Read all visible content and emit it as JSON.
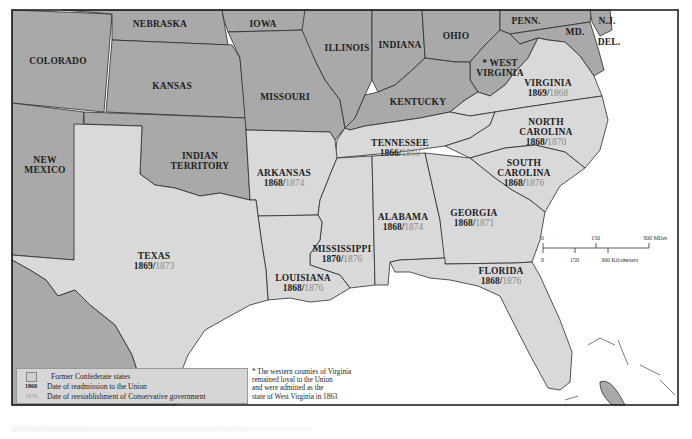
{
  "map": {
    "title": "Reconstruction: Readmission of Former Confederate States",
    "colors": {
      "union_states": "#a9a9a9",
      "confederate_states": "#d9d9d9",
      "water": "#ffffff",
      "readmission_year": "#1e1e1e",
      "conservative_year": "#8a8a8a"
    },
    "union_states": {
      "colorado": "COLORADO",
      "nebraska": "NEBRASKA",
      "iowa": "IOWA",
      "illinois": "ILLINOIS",
      "indiana": "INDIANA",
      "ohio": "OHIO",
      "penn": "PENN.",
      "nj": "N.J.",
      "md": "MD.",
      "del": "DEL.",
      "west_virginia_1": "* WEST",
      "west_virginia_2": "VIRGINIA",
      "kansas": "KANSAS",
      "missouri": "MISSOURI",
      "kentucky": "KENTUCKY",
      "new_mexico_1": "NEW",
      "new_mexico_2": "MEXICO",
      "indian_territory_1": "INDIAN",
      "indian_territory_2": "TERRITORY"
    },
    "confederate_states": {
      "virginia": {
        "name": "VIRGINIA",
        "readmitted": "1869",
        "conservative": "1868"
      },
      "north_carolina": {
        "name_1": "NORTH",
        "name_2": "CAROLINA",
        "readmitted": "1868",
        "conservative": "1870"
      },
      "tennessee": {
        "name": "TENNESSEE",
        "readmitted": "1866",
        "conservative": "1869"
      },
      "south_carolina": {
        "name_1": "SOUTH",
        "name_2": "CAROLINA",
        "readmitted": "1868",
        "conservative": "1876"
      },
      "arkansas": {
        "name": "ARKANSAS",
        "readmitted": "1868",
        "conservative": "1874"
      },
      "alabama": {
        "name": "ALABAMA",
        "readmitted": "1868",
        "conservative": "1874"
      },
      "georgia": {
        "name": "GEORGIA",
        "readmitted": "1868",
        "conservative": "1871"
      },
      "mississippi": {
        "name": "MISSISSIPPI",
        "readmitted": "1870",
        "conservative": "1876"
      },
      "texas": {
        "name": "TEXAS",
        "readmitted": "1869",
        "conservative": "1873"
      },
      "louisiana": {
        "name": "LOUISIANA",
        "readmitted": "1868",
        "conservative": "1876"
      },
      "florida": {
        "name": "FLORIDA",
        "readmitted": "1868",
        "conservative": "1876"
      }
    },
    "slash": "/"
  },
  "scale": {
    "miles": {
      "t0": "0",
      "t1": "150",
      "t2": "300 Miles"
    },
    "km": {
      "t0": "0",
      "t1": "150",
      "t2": "300 Kilometers"
    }
  },
  "legend": {
    "items": [
      {
        "key": "",
        "label": "Former Confederate states"
      },
      {
        "key": "1868",
        "label": "Date of readmission to the Union"
      },
      {
        "key": "1876",
        "label": "Date of reestablishment of Conservative government"
      }
    ]
  },
  "footnote": {
    "line1": "* The western counties of Virginia",
    "line2": "remained loyal to the Union",
    "line3": "and were admitted as the",
    "line4": "state of West Virginia in 1863"
  }
}
